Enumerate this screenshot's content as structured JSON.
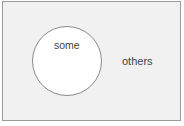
{
  "diagram": {
    "type": "venn",
    "inside_label": "some",
    "outside_label": "others",
    "colors": {
      "background": "#f1f1f1",
      "circle_fill": "#ffffff",
      "stroke": "#8a8a8a",
      "text": "#444444"
    }
  }
}
